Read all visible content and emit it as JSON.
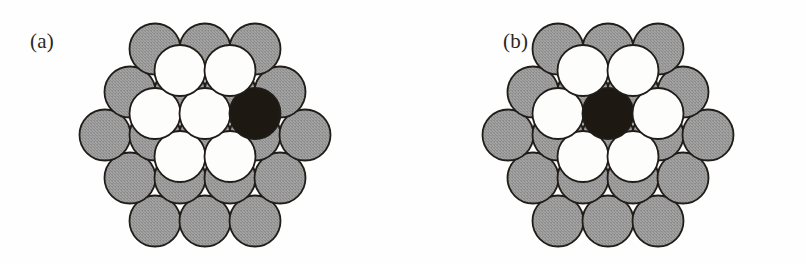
{
  "figure": {
    "kind": "atomic-cluster-packing-diagram",
    "background_color": "#fefefe",
    "panel_count": 2
  },
  "colors": {
    "substrate_gray": "#a3a3a3",
    "substrate_gray_dither_dark": "#8d8d8d",
    "adatom_white": "#fdfdfb",
    "adatom_black": "#1e1813",
    "outline": "#201c18",
    "label_text": "#2b2724",
    "page_background": "#fefefe"
  },
  "geometry": {
    "sphere_radius": 25.5,
    "row_pitch_x": 50,
    "row_pitch_y": 43,
    "outline_width": 1.8
  },
  "panels": [
    {
      "id": "a",
      "label": "(a)",
      "label_text": "(a)",
      "center_x": 205,
      "center_y": 135,
      "substrate": {
        "name": "substrate-layer",
        "atom_count": 19,
        "color_key": "substrate_gray",
        "row_counts": [
          3,
          4,
          5,
          4,
          3
        ],
        "arrangement": "hexagonal-close-packed"
      },
      "adlayer": {
        "name": "adatom-layer",
        "atom_count": 7,
        "white_count": 6,
        "black_count": 1,
        "arrangement": "hexagonal-7-atom-cluster",
        "black_atom_position": "upper-right",
        "black_atom_index": 2
      }
    },
    {
      "id": "b",
      "label": "(b)",
      "label_text": "(b)",
      "center_x": 205,
      "center_y": 135,
      "substrate": {
        "name": "substrate-layer",
        "atom_count": 19,
        "color_key": "substrate_gray",
        "row_counts": [
          3,
          4,
          5,
          4,
          3
        ],
        "arrangement": "hexagonal-close-packed"
      },
      "adlayer": {
        "name": "adatom-layer",
        "atom_count": 7,
        "white_count": 6,
        "black_count": 1,
        "arrangement": "hexagonal-7-atom-cluster",
        "black_atom_position": "center",
        "black_atom_index": 6
      }
    }
  ]
}
